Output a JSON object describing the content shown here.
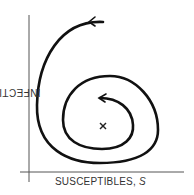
{
  "diagram": {
    "type": "phase-plane trajectory",
    "y_axis_label": "INFECTIVES,",
    "y_axis_var": "I",
    "x_axis_label": "SUSCEPTIBLES,",
    "x_axis_var": "S",
    "equilibrium_marker": "×",
    "trajectory": "inward spiral (counter-clockwise) toward equilibrium",
    "colors": {
      "ink": "#111111",
      "label": "#333333",
      "axis": "#555555"
    }
  }
}
